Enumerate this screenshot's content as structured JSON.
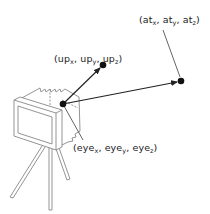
{
  "diagram": {
    "title": "",
    "points": {
      "eye": {
        "name": "eye",
        "x": 63,
        "y": 104
      },
      "up": {
        "name": "up",
        "x": 103,
        "y": 65
      },
      "at": {
        "name": "at",
        "x": 181,
        "y": 81
      }
    },
    "labels": {
      "at": {
        "open": "(",
        "p1": "at",
        "s1": "x",
        "p2": "at",
        "s2": "y",
        "p3": "at",
        "s3": "z",
        "close": ")",
        "sep": ", "
      },
      "up": {
        "open": "(",
        "p1": "up",
        "s1": "x",
        "p2": "up",
        "s2": "y",
        "p3": "up",
        "s3": "z",
        "close": ")",
        "sep": ", "
      },
      "eye": {
        "open": "(",
        "p1": "eye",
        "s1": "x",
        "p2": "eye",
        "s2": "y",
        "p3": "eye",
        "s3": "z",
        "close": ")",
        "sep": ", "
      }
    },
    "colors": {
      "ink": "#222222",
      "camera_stroke": "#888888"
    },
    "icon": "camera-on-tripod-icon"
  }
}
